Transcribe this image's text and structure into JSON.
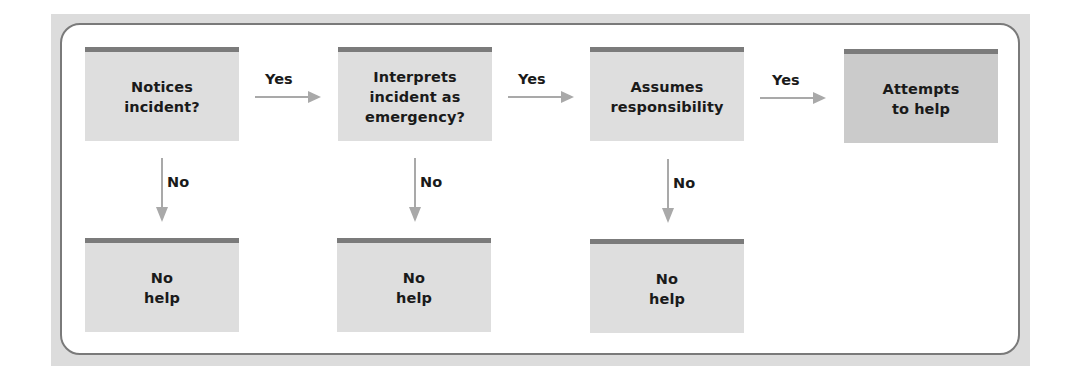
{
  "diagram": {
    "colors": {
      "frame": "#dcdcdc",
      "box_fill": "#dedede",
      "final_box_fill": "#cbcbcb",
      "box_top_bar": "#7b7b7b",
      "arrow": "#a9a9a9"
    },
    "steps": [
      {
        "label": "Notices\nincident?"
      },
      {
        "label": "Interprets\nincident as\nemergency?"
      },
      {
        "label": "Assumes\nresponsibility"
      },
      {
        "label": "Attempts\nto help"
      }
    ],
    "yes_label": "Yes",
    "no_label": "No",
    "outcomes": [
      {
        "label": "No\nhelp"
      },
      {
        "label": "No\nhelp"
      },
      {
        "label": "No\nhelp"
      }
    ],
    "edges": [
      {
        "from": "Notices incident?",
        "to": "Interprets incident as emergency?",
        "label": "Yes"
      },
      {
        "from": "Interprets incident as emergency?",
        "to": "Assumes responsibility",
        "label": "Yes"
      },
      {
        "from": "Assumes responsibility",
        "to": "Attempts to help",
        "label": "Yes"
      },
      {
        "from": "Notices incident?",
        "to": "No help",
        "label": "No"
      },
      {
        "from": "Interprets incident as emergency?",
        "to": "No help",
        "label": "No"
      },
      {
        "from": "Assumes responsibility",
        "to": "No help",
        "label": "No"
      }
    ]
  }
}
